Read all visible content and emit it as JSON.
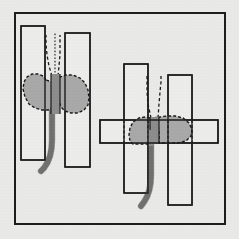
{
  "figure": {
    "canvas": {
      "width": 239,
      "height": 239
    },
    "colors": {
      "background": "#e9e9e7",
      "frame_stroke": "#1c1c1c",
      "plate_fill": "#ececea",
      "plate_stroke": "#1a1a1a",
      "nugget_fill": "#a8a8a8",
      "nugget_gap_fill": "#8b8b8b",
      "nugget_stroke": "#1a1a1a",
      "electrode_fill": "#8c8c8c",
      "electrode_stroke": "#3a3a3a",
      "dashed_stroke": "#1a1a1a"
    },
    "frame": {
      "x": 15,
      "y": 13,
      "width": 210,
      "height": 211
    },
    "panels": [
      {
        "id": "left-panel",
        "name": "lap-joint-detail",
        "label": "",
        "plates": [
          {
            "name": "left-vertical-plate",
            "x": 21,
            "y": 26,
            "width": 24,
            "height": 134
          },
          {
            "name": "right-vertical-plate",
            "x": 65,
            "y": 33,
            "width": 25,
            "height": 134
          }
        ],
        "nugget": {
          "name": "weld-nugget",
          "path": "M 46 80 L 43 76 L 38 74 L 32 74 L 27 77 L 24 82 L 23 89 L 25 97 L 29 104 L 35 108 L 42 110 L 48 110 L 52 108 L 54 103 L 54 96 L 56 92 L 58 95 L 59 101 L 61 107 L 65 111 L 71 113 L 78 113 L 84 110 L 88 105 L 89 98 L 88 90 L 85 83 L 80 78 L 73 75 L 66 75 L 60 77 L 56 81 L 52 82 Z"
        },
        "gap_column": {
          "name": "joint-gap-column",
          "x": 51,
          "y": 74,
          "width": 9,
          "height": 40
        },
        "center_line_x": 55.5,
        "dashed_guides": [
          {
            "name": "fusion-line-left",
            "d": "M 52 76 L 49 66 L 47 55 L 46 44 L 46 35"
          },
          {
            "name": "fusion-line-right",
            "d": "M 58 76 L 59 66 L 60 55 L 60 44 L 60 35"
          },
          {
            "name": "fusion-line-center",
            "d": "M 55 76 L 55 64 L 55 52 L 55 40 L 55 33"
          }
        ],
        "electrode": {
          "name": "electrode-tail",
          "d": "M 52 110 L 52 140 Q 52 158 44 168 L 41 171",
          "width": 5.5
        }
      },
      {
        "id": "right-panel",
        "name": "cruciform-joint-detail",
        "label": "",
        "plates": [
          {
            "name": "left-vertical-plate",
            "x": 124,
            "y": 64,
            "width": 24,
            "height": 129
          },
          {
            "name": "right-vertical-plate",
            "x": 168,
            "y": 75,
            "width": 24,
            "height": 130
          },
          {
            "name": "horizontal-plate",
            "x": 100,
            "y": 120,
            "width": 118,
            "height": 23
          }
        ],
        "nugget": {
          "name": "weld-nugget",
          "path": "M 150 118 L 145 117 L 139 118 L 133 122 L 130 128 L 129 135 L 130 141 L 133 144 L 150 144 L 152 140 L 152 130 L 154 124 L 156 118 L 158 124 L 159 132 L 159 143 L 170 143 L 178 143 L 186 141 L 191 136 L 192 129 L 189 123 L 183 118 L 175 116 L 167 116 L 160 117 L 155 119 Z"
        },
        "gap_column": {
          "name": "joint-gap-column",
          "x": 150,
          "y": 117,
          "width": 9,
          "height": 27
        },
        "center_line_x": 154.5,
        "dashed_guides": [
          {
            "name": "fusion-line-left",
            "d": "M 151 118 L 148 104 L 147 92 L 147 82 L 147 76"
          },
          {
            "name": "fusion-line-right",
            "d": "M 158 118 L 159 104 L 160 92 L 161 82 L 161 76"
          },
          {
            "name": "plate-edge-left-a",
            "d": "M 124 120 L 124 143"
          },
          {
            "name": "plate-edge-left-b",
            "d": "M 148 120 L 148 143"
          },
          {
            "name": "plate-edge-right-a",
            "d": "M 168 120 L 168 143"
          },
          {
            "name": "plate-edge-right-b",
            "d": "M 192 120 L 192 143"
          }
        ],
        "electrode": {
          "name": "electrode-tail",
          "d": "M 151 144 L 151 175 Q 151 192 144 202 L 141 206",
          "width": 5.5
        }
      }
    ]
  }
}
